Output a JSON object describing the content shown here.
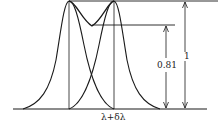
{
  "diagram": {
    "type": "rayleigh-criterion",
    "labels": {
      "wavelength": "λ+δλ",
      "dip_ratio": "0.81",
      "peak_ratio": "1"
    },
    "colors": {
      "line": "#1a1a1a",
      "background": "#ffffff"
    }
  }
}
